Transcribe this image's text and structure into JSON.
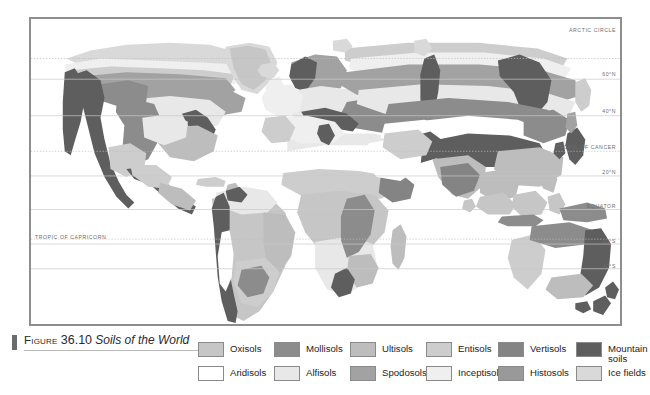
{
  "figure": {
    "label_word": "Figure",
    "number": "36.10",
    "title": "Soils of the World"
  },
  "map": {
    "latitude_labels": [
      {
        "text": "ARCTIC CIRCLE",
        "side": "right",
        "y_pct": 13.0
      },
      {
        "text": "60°N",
        "side": "right",
        "y_pct": 19.8
      },
      {
        "text": "40°N",
        "side": "right",
        "y_pct": 31.8
      },
      {
        "text": "TROPIC OF CANCER",
        "side": "right",
        "y_pct": 43.5
      },
      {
        "text": "20°N",
        "side": "right",
        "y_pct": 51.5
      },
      {
        "text": "EQUATOR",
        "side": "right",
        "y_pct": 62.5
      },
      {
        "text": "20°S",
        "side": "right",
        "y_pct": 73.8
      },
      {
        "text": "40°S",
        "side": "right",
        "y_pct": 82.0
      },
      {
        "text": "TROPIC OF CAPRICORN",
        "side": "left",
        "y_pct": 72.2
      }
    ],
    "frame_color": "#8e8e8e",
    "ocean_color": "#ffffff"
  },
  "legend": {
    "rows": [
      [
        {
          "label": "Oxisols",
          "color": "#c6c6c6"
        },
        {
          "label": "Mollisols",
          "color": "#8c8c8c"
        },
        {
          "label": "Ultisols",
          "color": "#bdbdbd"
        },
        {
          "label": "Entisols",
          "color": "#cdcdcd"
        },
        {
          "label": "Vertisols",
          "color": "#848484"
        },
        {
          "label": "Mountain\nsoils",
          "color": "#5e5e5e"
        }
      ],
      [
        {
          "label": "Aridisols",
          "color": "#ffffff"
        },
        {
          "label": "Alfisols",
          "color": "#e8e8e8"
        },
        {
          "label": "Spodosols",
          "color": "#a2a2a2"
        },
        {
          "label": "Inceptisols",
          "color": "#efefef"
        },
        {
          "label": "Histosols",
          "color": "#999999"
        },
        {
          "label": "Ice fields",
          "color": "#d9d9d9"
        }
      ]
    ]
  },
  "palette": {
    "oxisols": "#c6c6c6",
    "mollisols": "#8c8c8c",
    "ultisols": "#bdbdbd",
    "entisols": "#cdcdcd",
    "vertisols": "#848484",
    "mountain_soils": "#5e5e5e",
    "aridisols": "#ffffff",
    "alfisols": "#e8e8e8",
    "spodosols": "#a2a2a2",
    "inceptisols": "#efefef",
    "histosols": "#999999",
    "ice_fields": "#d9d9d9",
    "coastline": "#b0b0b0",
    "graticule": "#cccccc",
    "graticule_dotted": "#bdbdbd"
  }
}
